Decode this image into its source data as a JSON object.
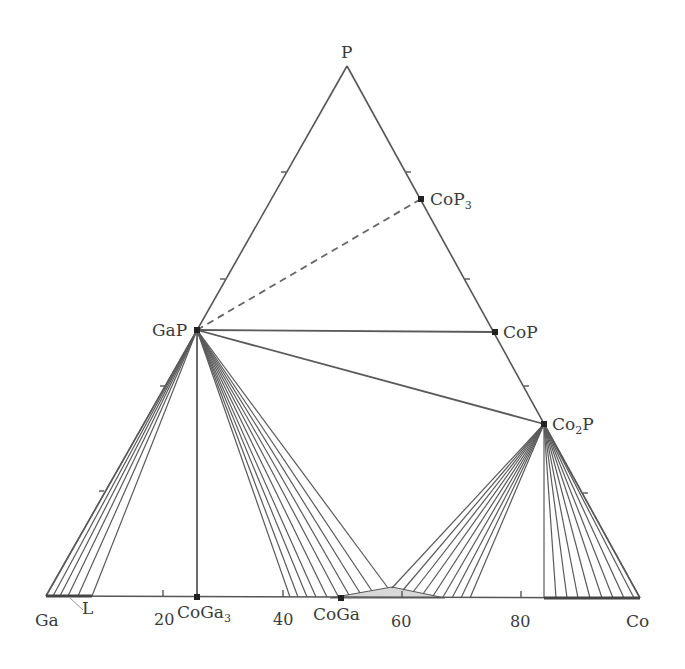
{
  "diagram": {
    "type": "ternary-phase-diagram",
    "system": "Ga-Co-P",
    "vertices": {
      "top": {
        "label": "P",
        "x": 347,
        "y": 66
      },
      "left": {
        "label": "Ga",
        "x": 46,
        "y": 596
      },
      "right": {
        "label": "Co",
        "x": 640,
        "y": 598
      }
    },
    "bottom_axis": {
      "ticks": [
        {
          "label": "20",
          "x": 163
        },
        {
          "label": "40",
          "x": 283
        },
        {
          "label": "60",
          "x": 402
        },
        {
          "label": "80",
          "x": 521
        }
      ]
    },
    "phases": [
      {
        "id": "GaP",
        "label": "GaP",
        "sub": "",
        "x": 197,
        "y": 330
      },
      {
        "id": "CoP",
        "label": "CoP",
        "sub": "",
        "x": 495,
        "y": 332
      },
      {
        "id": "Co2P",
        "label": "Co",
        "sub": "2",
        "suffix": "P",
        "x": 544,
        "y": 424
      },
      {
        "id": "CoP3",
        "label": "CoP",
        "sub": "3",
        "x": 421,
        "y": 199
      },
      {
        "id": "CoGa3",
        "label": "CoGa",
        "sub": "3",
        "x": 197,
        "y": 597
      },
      {
        "id": "CoGa",
        "label": "CoGa",
        "sub": "",
        "x": 341,
        "y": 598
      }
    ],
    "liquid_label": "L",
    "colors": {
      "line": "#555555",
      "tie_line": "#5a5a5a",
      "shaded_region": "#d8d8d8",
      "text": "#3a3a3a"
    }
  }
}
